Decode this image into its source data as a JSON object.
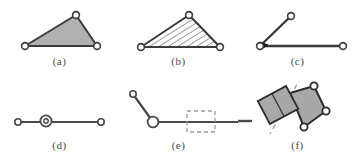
{
  "figure": {
    "width": 357,
    "height": 162,
    "background": "#ffffff",
    "stroke_color": "#3a3a3a",
    "fill_gray": "#b0b0b0",
    "dash_color": "#9a9a9a",
    "joint_fill": "#ffffff"
  },
  "panels": [
    {
      "id": "a",
      "caption": "(a)",
      "shape": "triangle",
      "fill": "solid-gray",
      "joints": 3,
      "description": "Triangle with solid gray fill and open circular joints at all three vertices"
    },
    {
      "id": "b",
      "caption": "(b)",
      "shape": "triangle",
      "fill": "diagonal-hatch",
      "joints": 3,
      "description": "Triangle with diagonal hatch fill and open circular joints at all three vertices"
    },
    {
      "id": "c",
      "caption": "(c)",
      "shape": "two-bar-linkage",
      "fill": "none",
      "joints": 3,
      "description": "Two bars meeting at a filled wedge joint, one bar angled up-right, one bar horizontal to the right"
    },
    {
      "id": "d",
      "caption": "(d)",
      "shape": "horizontal-bar",
      "fill": "none",
      "joints": 3,
      "description": "Straight horizontal bar with small circular end joints and a larger bearing circle at the middle"
    },
    {
      "id": "e",
      "caption": "(e)",
      "shape": "bent-bar-with-dashed-box",
      "fill": "none",
      "joints": 2,
      "description": "Short angled bar joining a long horizontal bar at a bearing circle, with a dashed rectangle straddling the horizontal bar"
    },
    {
      "id": "f",
      "caption": "(f)",
      "shape": "quadrilateral-with-slider",
      "fill": "solid-gray",
      "joints": 3,
      "description": "Tilted gray quadrilateral with circular joints, overlapped by a rotated gray rectangular slider block on a dashed axis line"
    }
  ]
}
